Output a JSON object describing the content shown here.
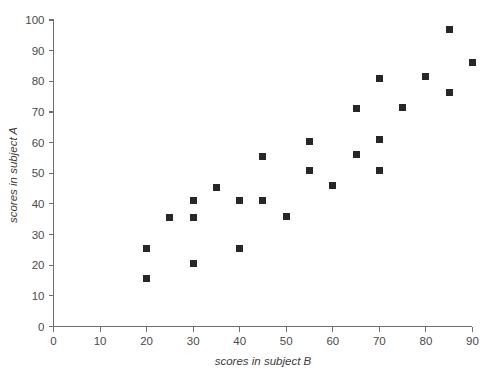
{
  "chart_data": {
    "type": "scatter",
    "title": "",
    "xlabel": "scores in subject B",
    "ylabel": "scores in subject A",
    "xlim": [
      0,
      90
    ],
    "ylim": [
      0,
      100
    ],
    "xticks": [
      0,
      10,
      20,
      30,
      40,
      50,
      60,
      70,
      80,
      90
    ],
    "yticks": [
      0,
      10,
      20,
      30,
      40,
      50,
      60,
      70,
      80,
      90,
      100
    ],
    "xtick_labels": [
      "0",
      "10",
      "20",
      "30",
      "40",
      "50",
      "60",
      "70",
      "80",
      "90"
    ],
    "ytick_labels": [
      "0",
      "10",
      "20",
      "30",
      "40",
      "50",
      "60",
      "70",
      "80",
      "90",
      "100"
    ],
    "grid": false,
    "legend": null,
    "marker": "square",
    "marker_color": "#272727",
    "marker_size": 7,
    "points": [
      {
        "x": 20,
        "y": 15.5
      },
      {
        "x": 20,
        "y": 25.5
      },
      {
        "x": 25,
        "y": 35.5
      },
      {
        "x": 30,
        "y": 20.5
      },
      {
        "x": 30,
        "y": 35.5
      },
      {
        "x": 30,
        "y": 41
      },
      {
        "x": 35,
        "y": 45.5
      },
      {
        "x": 40,
        "y": 25.5
      },
      {
        "x": 40,
        "y": 41
      },
      {
        "x": 45,
        "y": 41
      },
      {
        "x": 45,
        "y": 55.5
      },
      {
        "x": 50,
        "y": 36
      },
      {
        "x": 55,
        "y": 51
      },
      {
        "x": 55,
        "y": 60.5
      },
      {
        "x": 60,
        "y": 46
      },
      {
        "x": 65,
        "y": 56
      },
      {
        "x": 65,
        "y": 71
      },
      {
        "x": 70,
        "y": 51
      },
      {
        "x": 70,
        "y": 61
      },
      {
        "x": 70,
        "y": 81
      },
      {
        "x": 75,
        "y": 71.5
      },
      {
        "x": 80,
        "y": 81.5
      },
      {
        "x": 85,
        "y": 76.5
      },
      {
        "x": 85,
        "y": 97
      },
      {
        "x": 90,
        "y": 86
      }
    ]
  },
  "axis": {
    "color": "#6e6e6e",
    "tick_label_color": "#4a4a4a",
    "title_color": "#3d3d3d"
  }
}
